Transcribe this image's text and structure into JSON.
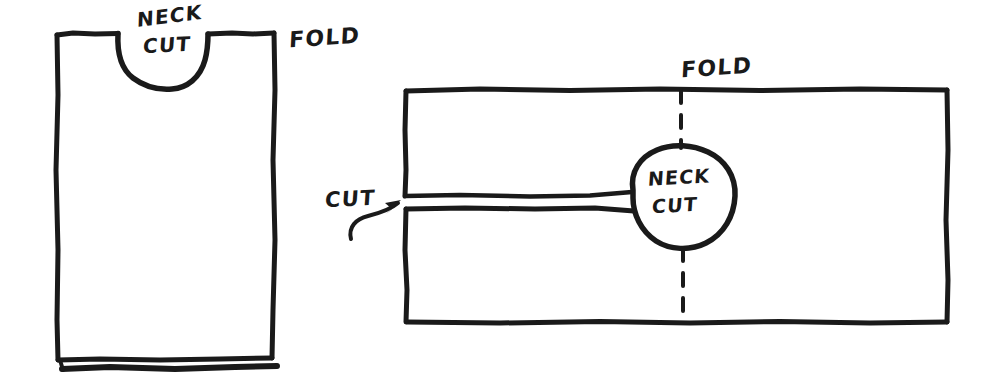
{
  "diagram": {
    "ink_color": "#1a1a1a",
    "background_color": "#ffffff",
    "figures": [
      {
        "name": "folded-shirt-front",
        "description": "Folded shirt body with neck cut scooped out of the top edge",
        "labels": [
          "NECK",
          "CUT",
          "FOLD"
        ]
      },
      {
        "name": "unfolded-fabric-flat",
        "description": "Flat rectangle of fabric showing the straight cut line and round neck cut centered on the fold",
        "labels": [
          "FOLD",
          "CUT",
          "NECK",
          "CUT"
        ]
      }
    ]
  },
  "shirt": {
    "neck_label_line1": "NECK",
    "neck_label_line2": "CUT",
    "fold_label": "FOLD"
  },
  "flat": {
    "fold_label": "FOLD",
    "cut_label": "CUT",
    "neck_label_line1": "NECK",
    "neck_label_line2": "CUT"
  }
}
